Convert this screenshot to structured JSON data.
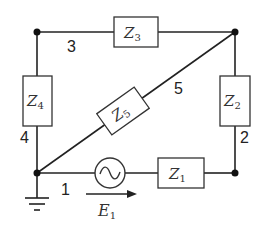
{
  "diagram": {
    "type": "electrical-circuit",
    "elements": {
      "Z1": {
        "letter": "Z",
        "sub": "1"
      },
      "Z2": {
        "letter": "Z",
        "sub": "2"
      },
      "Z3": {
        "letter": "Z",
        "sub": "3"
      },
      "Z4": {
        "letter": "Z",
        "sub": "4"
      },
      "Z5": {
        "letter": "Z",
        "sub": "5"
      },
      "E1": {
        "letter": "E",
        "sub": "1"
      }
    },
    "branch_labels": {
      "b1": "1",
      "b2": "2",
      "b3": "3",
      "b4": "4",
      "b5": "5"
    },
    "source_symbol": "~",
    "colors": {
      "line": "#222222",
      "box_stroke": "#333333",
      "background": "#ffffff"
    }
  }
}
